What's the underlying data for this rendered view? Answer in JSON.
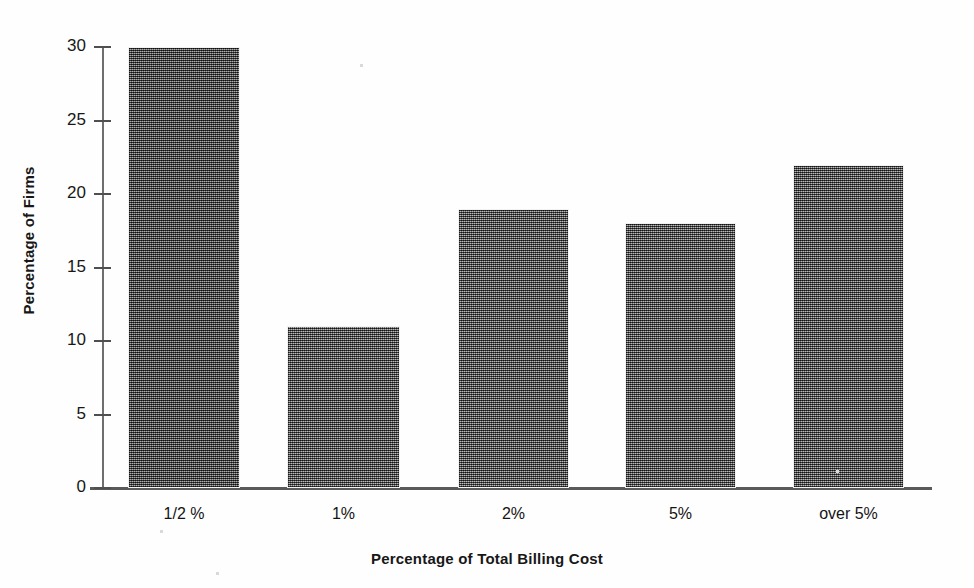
{
  "chart_data": {
    "type": "bar",
    "title": "",
    "xlabel": "Percentage of Total Billing Cost",
    "ylabel": "Percentage of Firms",
    "categories": [
      "1/2 %",
      "1%",
      "2%",
      "5%",
      "over 5%"
    ],
    "values": [
      30,
      11,
      19,
      18,
      22
    ],
    "ylim": [
      0,
      30
    ],
    "yticks": [
      0,
      5,
      10,
      15,
      20,
      25,
      30
    ],
    "ytick_labels": [
      "0",
      "5",
      "10",
      "15",
      "20",
      "25",
      "30"
    ],
    "grid": false,
    "legend": false,
    "legend_position": "none",
    "bar_fill": "#6e6e6e",
    "bar_style": "dithered-halftone-gray",
    "axis_color": "#5a5a5a",
    "background": "#ffffff"
  },
  "axes": {
    "y_title": "Percentage of Firms",
    "x_title": "Percentage of Total Billing Cost"
  }
}
